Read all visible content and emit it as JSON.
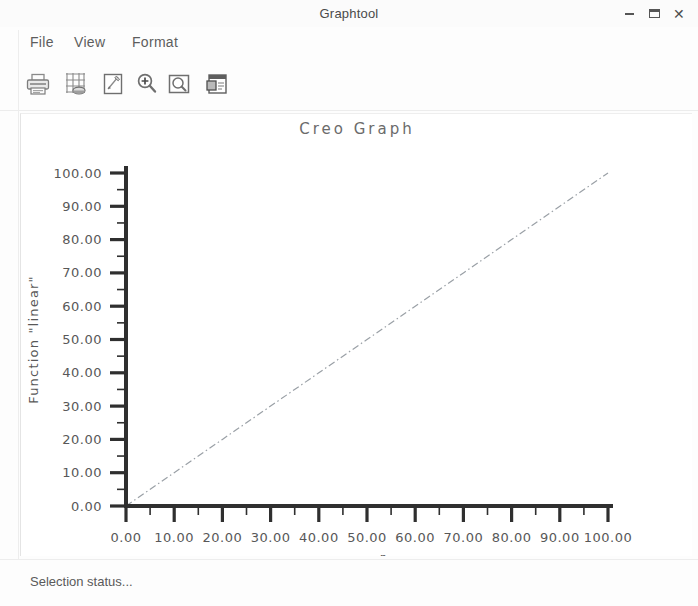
{
  "window": {
    "title": "Graphtool",
    "controls": [
      {
        "name": "minimize",
        "label": "–"
      },
      {
        "name": "maximize",
        "label": "□"
      },
      {
        "name": "close",
        "label": "✕"
      }
    ]
  },
  "menubar": {
    "items": [
      {
        "label": "File"
      },
      {
        "label": "View"
      },
      {
        "label": "Format"
      }
    ]
  },
  "toolbar": {
    "buttons": [
      {
        "icon": "printer-icon",
        "label": "Print"
      },
      {
        "icon": "graph-grid-icon",
        "label": "Graph Settings"
      },
      {
        "icon": "edit-note-icon",
        "label": "Edit"
      },
      {
        "icon": "zoom-in-icon",
        "label": "Zoom In"
      },
      {
        "icon": "zoom-area-icon",
        "label": "Zoom Area"
      },
      {
        "icon": "export-window-icon",
        "label": "Export"
      }
    ]
  },
  "statusbar": {
    "text": "Selection status..."
  },
  "chart_data": {
    "type": "line",
    "title": "Creo Graph",
    "xlabel": "r",
    "ylabel": "Function \"linear\"",
    "xlim": [
      0,
      100
    ],
    "ylim": [
      0,
      100
    ],
    "grid": false,
    "legend": false,
    "xticks": [
      "0.00",
      "10.00",
      "20.00",
      "30.00",
      "40.00",
      "50.00",
      "60.00",
      "70.00",
      "80.00",
      "90.00",
      "100.00"
    ],
    "xtick_values": [
      0,
      10,
      20,
      30,
      40,
      50,
      60,
      70,
      80,
      90,
      100
    ],
    "yticks": [
      "0.00",
      "10.00",
      "20.00",
      "30.00",
      "40.00",
      "50.00",
      "60.00",
      "70.00",
      "80.00",
      "90.00",
      "100.00"
    ],
    "ytick_values": [
      0,
      10,
      20,
      30,
      40,
      50,
      60,
      70,
      80,
      90,
      100
    ],
    "minor_tick_interval": 5,
    "series": [
      {
        "name": "linear",
        "linestyle": "dash-dot",
        "color": "#9aa0a6",
        "x": [
          0,
          10,
          20,
          30,
          40,
          50,
          60,
          70,
          80,
          90,
          100
        ],
        "values": [
          0,
          10,
          20,
          30,
          40,
          50,
          60,
          70,
          80,
          90,
          100
        ]
      }
    ]
  },
  "colors": {
    "axis": "#2f2f2f",
    "text": "#585858",
    "panel_bg": "#ffffff",
    "chrome_bg": "#fdfdfd",
    "series": "#9aa0a6"
  }
}
